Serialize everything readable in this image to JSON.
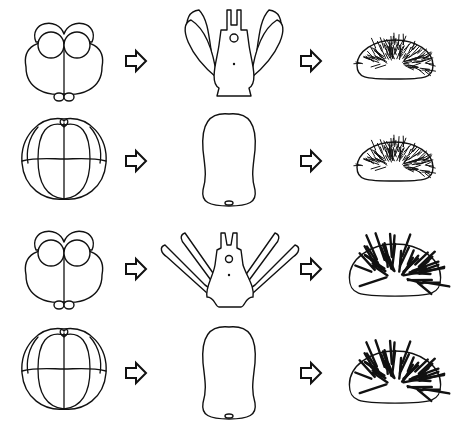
{
  "figure": {
    "rows": [
      {
        "embryo": "embryo-16cell-with-micromeres",
        "larva": "pluteus-short-arms",
        "adult": "urchin-fine-spines"
      },
      {
        "embryo": "embryo-16cell-no-micromeres",
        "larva": "ovoid-non-feeding-larva",
        "adult": "urchin-fine-spines"
      },
      {
        "embryo": "embryo-16cell-with-micromeres",
        "larva": "pluteus-long-arms",
        "adult": "urchin-thick-spines"
      },
      {
        "embryo": "embryo-16cell-no-micromeres",
        "larva": "ovoid-non-feeding-larva",
        "adult": "urchin-thick-spines"
      }
    ],
    "arrow_icon": "right-outline-arrow",
    "colors": {
      "line": "#111111",
      "background": "#ffffff"
    }
  }
}
